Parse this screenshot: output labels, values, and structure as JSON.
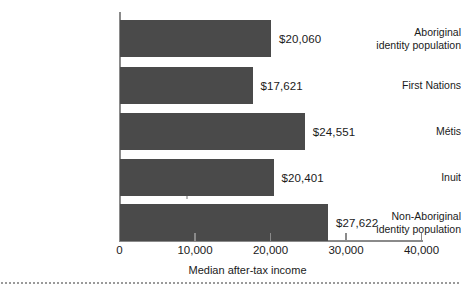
{
  "chart_data": {
    "type": "bar",
    "orientation": "horizontal",
    "title": "",
    "xlabel": "Median after-tax income",
    "ylabel": "",
    "xlim": [
      0,
      40000
    ],
    "xticks": [
      "0",
      "10,000",
      "20,000",
      "30,000",
      "40,000"
    ],
    "xtick_values": [
      0,
      10000,
      20000,
      30000,
      40000
    ],
    "grid": false,
    "legend": "none",
    "bar_color": "#4a4a4a",
    "axis_color": "#8a8a8a",
    "background_color": "#ffffff",
    "categories": [
      "Aboriginal\nidentity population",
      "First Nations",
      "Métis",
      "Inuit",
      "Non-Aboriginal\nidentity population"
    ],
    "values": [
      20060,
      17621,
      24551,
      20401,
      27622
    ],
    "value_labels": [
      "$20,060",
      "$17,621",
      "$24,551",
      "$20,401",
      "$27,622"
    ]
  }
}
